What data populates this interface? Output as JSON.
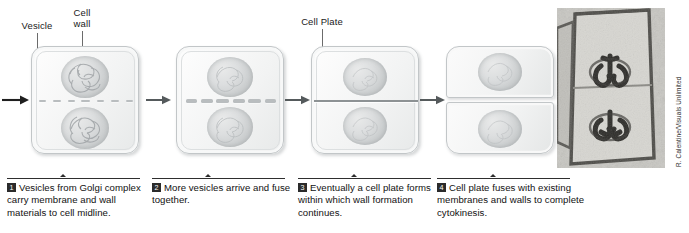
{
  "figure": {
    "credit": "R. Calentine/Visuals Unlimited"
  },
  "callouts": [
    {
      "id": "vesicle",
      "label": "Vesicle"
    },
    {
      "id": "cell-wall",
      "label": "Cell\nwall"
    },
    {
      "id": "cell-plate",
      "label": "Cell Plate"
    }
  ],
  "steps": [
    {
      "number": "1",
      "text": "Vesicles from Golgi complex carry membrane and wall materials to cell midline."
    },
    {
      "number": "2",
      "text": "More vesicles arrive and fuse together."
    },
    {
      "number": "3",
      "text": "Eventually a cell plate forms within which wall formation continues."
    },
    {
      "number": "4",
      "text": "Cell plate fuses with existing membranes and walls to complete cytokinesis."
    }
  ],
  "colors": {
    "cell_outline": "#c2c6c8",
    "cell_fill": "#f2f3f3",
    "chromatin": "#bfc2c4",
    "vesicle": "#b9bdbf",
    "cell_plate": "#8d9294",
    "arrow": "#2b2b2b",
    "caption_rule": "#2e2e2e",
    "badge": "#2b2b2b",
    "micrograph_bg": "#9a9a96"
  }
}
